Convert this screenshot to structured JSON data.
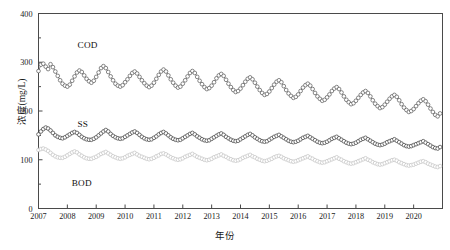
{
  "chart_data": {
    "type": "line",
    "title": "",
    "xlabel": "年份",
    "ylabel": "浓度(mg/L)",
    "xlim": [
      2007.0,
      2021.0
    ],
    "ylim": [
      0,
      400
    ],
    "yticks": [
      0,
      100,
      200,
      300,
      400
    ],
    "xticks": [
      2007,
      2008,
      2009,
      2010,
      2011,
      2012,
      2013,
      2014,
      2015,
      2016,
      2017,
      2018,
      2019,
      2020
    ],
    "xtick_labels": [
      "2007",
      "2008",
      "2009",
      "2010",
      "2011",
      "2012",
      "2013",
      "2014",
      "2015",
      "2016",
      "2017",
      "2018",
      "2019",
      "2020"
    ],
    "ytick_labels": [
      "0",
      "100",
      "200",
      "300",
      "400"
    ],
    "grid": false,
    "legend_position": "inline-annotation",
    "marker": "open-circle",
    "x_start": 2007.0,
    "x_step": 0.08333,
    "series": [
      {
        "name": "COD",
        "color": "#555555",
        "label_x": 2008.35,
        "label_y": 345,
        "values": [
          282,
          295,
          297,
          291,
          286,
          296,
          290,
          281,
          272,
          263,
          256,
          252,
          250,
          254,
          262,
          271,
          279,
          283,
          280,
          273,
          266,
          261,
          258,
          262,
          270,
          279,
          288,
          292,
          288,
          280,
          271,
          263,
          256,
          252,
          250,
          253,
          259,
          265,
          272,
          278,
          281,
          277,
          270,
          263,
          257,
          252,
          249,
          252,
          258,
          266,
          274,
          281,
          285,
          281,
          273,
          265,
          258,
          252,
          248,
          250,
          256,
          263,
          271,
          278,
          282,
          278,
          270,
          262,
          255,
          249,
          245,
          247,
          252,
          259,
          267,
          273,
          276,
          272,
          264,
          256,
          249,
          243,
          239,
          241,
          246,
          253,
          260,
          266,
          269,
          265,
          258,
          250,
          243,
          237,
          233,
          235,
          240,
          247,
          254,
          260,
          263,
          259,
          251,
          243,
          236,
          231,
          227,
          229,
          234,
          241,
          248,
          253,
          256,
          252,
          245,
          237,
          230,
          225,
          221,
          223,
          228,
          234,
          241,
          246,
          249,
          245,
          238,
          230,
          223,
          218,
          214,
          216,
          221,
          227,
          233,
          238,
          241,
          237,
          230,
          222,
          215,
          210,
          206,
          208,
          213,
          219,
          225,
          230,
          233,
          229,
          222,
          214,
          207,
          202,
          198,
          200,
          204,
          210,
          216,
          221,
          224,
          220,
          213,
          205,
          198,
          192,
          189,
          195
        ]
      },
      {
        "name": "SS",
        "color": "#3a3a3a",
        "label_x": 2008.35,
        "label_y": 183,
        "values": [
          152,
          158,
          163,
          166,
          164,
          160,
          155,
          150,
          147,
          145,
          144,
          146,
          149,
          152,
          155,
          157,
          155,
          151,
          147,
          144,
          142,
          141,
          141,
          143,
          146,
          150,
          154,
          158,
          161,
          158,
          153,
          149,
          146,
          144,
          143,
          144,
          147,
          150,
          153,
          156,
          158,
          155,
          151,
          147,
          144,
          142,
          141,
          142,
          145,
          148,
          152,
          155,
          157,
          154,
          150,
          146,
          143,
          141,
          140,
          141,
          144,
          147,
          150,
          153,
          155,
          152,
          148,
          145,
          142,
          140,
          139,
          140,
          143,
          146,
          149,
          152,
          154,
          151,
          147,
          144,
          141,
          139,
          138,
          139,
          142,
          145,
          148,
          151,
          153,
          150,
          146,
          143,
          140,
          138,
          137,
          138,
          141,
          144,
          147,
          149,
          151,
          148,
          145,
          142,
          139,
          137,
          136,
          137,
          139,
          142,
          145,
          147,
          149,
          146,
          143,
          140,
          137,
          135,
          134,
          135,
          137,
          140,
          143,
          145,
          147,
          144,
          141,
          138,
          135,
          133,
          132,
          133,
          135,
          138,
          141,
          143,
          145,
          142,
          139,
          136,
          133,
          131,
          130,
          131,
          133,
          136,
          138,
          140,
          142,
          139,
          136,
          133,
          130,
          128,
          127,
          128,
          130,
          132,
          134,
          136,
          138,
          135,
          132,
          129,
          126,
          124,
          123,
          126
        ]
      },
      {
        "name": "BOD",
        "color": "#c2c2c2",
        "label_x": 2008.15,
        "label_y": 62,
        "values": [
          120,
          122,
          123,
          121,
          118,
          114,
          110,
          107,
          105,
          104,
          104,
          106,
          109,
          112,
          115,
          117,
          115,
          111,
          108,
          105,
          103,
          102,
          102,
          104,
          106,
          109,
          112,
          114,
          116,
          113,
          110,
          107,
          105,
          103,
          102,
          103,
          105,
          108,
          110,
          112,
          114,
          111,
          108,
          106,
          104,
          102,
          101,
          102,
          104,
          107,
          109,
          112,
          113,
          111,
          108,
          105,
          103,
          101,
          100,
          101,
          103,
          106,
          108,
          110,
          112,
          109,
          106,
          104,
          102,
          100,
          99,
          100,
          102,
          105,
          107,
          109,
          111,
          108,
          106,
          103,
          101,
          99,
          98,
          99,
          101,
          104,
          106,
          108,
          110,
          107,
          105,
          102,
          100,
          98,
          97,
          98,
          100,
          102,
          105,
          107,
          108,
          106,
          103,
          101,
          99,
          97,
          96,
          97,
          99,
          101,
          103,
          105,
          107,
          104,
          102,
          99,
          97,
          95,
          94,
          95,
          97,
          99,
          101,
          103,
          105,
          102,
          100,
          97,
          95,
          93,
          92,
          93,
          95,
          97,
          99,
          101,
          103,
          100,
          98,
          95,
          93,
          91,
          90,
          91,
          93,
          95,
          97,
          99,
          100,
          98,
          95,
          93,
          91,
          89,
          88,
          89,
          90,
          92,
          94,
          96,
          97,
          95,
          92,
          90,
          88,
          86,
          85,
          87
        ]
      }
    ]
  }
}
